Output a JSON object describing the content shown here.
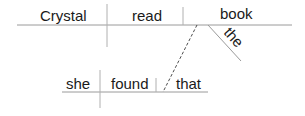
{
  "diagram": {
    "type": "sentence-diagram",
    "sentence": "Crystal read the book that she found",
    "main_clause": {
      "subject": "Crystal",
      "verb": "read",
      "object": "book",
      "modifiers": [
        {
          "word": "the",
          "modifies": "book"
        }
      ]
    },
    "relative_clause": {
      "subject": "she",
      "verb": "found",
      "object": "that",
      "connector": {
        "style": "dashed",
        "from": "book",
        "to": "that"
      }
    }
  }
}
